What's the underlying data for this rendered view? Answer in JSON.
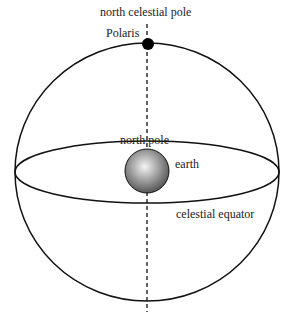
{
  "diagram": {
    "labels": {
      "ncp": "north celestial pole",
      "polaris": "Polaris",
      "north_pole": "north pole",
      "earth": "earth",
      "equator": "celestial equator"
    },
    "colors": {
      "line": "#111111",
      "earth_light": "#f2f2f2",
      "earth_dark": "#555555"
    }
  }
}
